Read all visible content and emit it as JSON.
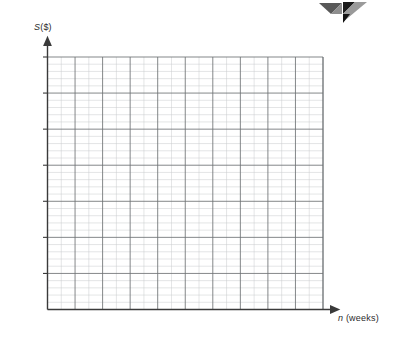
{
  "chart_data": {
    "type": "line",
    "title": "",
    "subtitle": "",
    "xlabel": "n (weeks)",
    "xlabel_symbol": "n",
    "xlabel_unit": "(weeks)",
    "ylabel": "S ($)",
    "ylabel_symbol": "S",
    "ylabel_unit": "($)",
    "xlim": [
      0,
      20
    ],
    "ylim": [
      0,
      700
    ],
    "x_ticks": [
      2,
      4,
      6,
      8,
      10,
      12,
      14,
      16,
      18,
      20
    ],
    "x_tick_labels": [
      "2",
      "4",
      "6",
      "8",
      "10",
      "12",
      "14",
      "16",
      "18",
      "20"
    ],
    "y_ticks": [
      100,
      200,
      300,
      400,
      500,
      600,
      700
    ],
    "y_tick_labels": [
      "100",
      "200",
      "300",
      "400",
      "500",
      "600",
      "700"
    ],
    "x_minor_step": 1,
    "y_minor_step": 20,
    "grid": true,
    "grid_major_color": "#6e7174",
    "grid_minor_color": "#c9cbcd",
    "axis_color": "#3a3a3a",
    "legend": null,
    "legend_position": "none",
    "origin_label": "O",
    "series": [
      {
        "name": "Savings",
        "color": "#8a8a8a",
        "line_style": "solid",
        "arrow_end": true,
        "x": [
          0,
          2,
          4,
          6,
          8,
          10,
          12,
          14,
          16,
          18,
          20
        ],
        "values": [
          80,
          142,
          204,
          266,
          328,
          390,
          452,
          514,
          576,
          638,
          700
        ],
        "y_intercept": 80,
        "slope": 31
      }
    ]
  },
  "decor": {
    "corner_mark": "pinwheel-logo",
    "colors": [
      "#555555",
      "#8c8c8c",
      "#111111",
      "#3d3d3d"
    ]
  }
}
